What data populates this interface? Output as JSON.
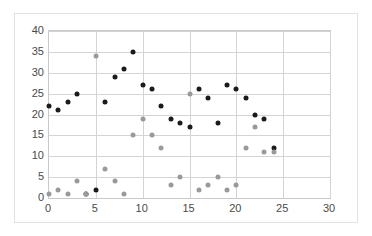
{
  "chart_data": {
    "type": "scatter",
    "title": "",
    "xlabel": "",
    "ylabel": "",
    "xlim": [
      0,
      30
    ],
    "ylim": [
      0,
      40
    ],
    "xticks": [
      0,
      5,
      10,
      15,
      20,
      25,
      30
    ],
    "yticks": [
      0,
      5,
      10,
      15,
      20,
      25,
      30,
      35,
      40
    ],
    "grid": true,
    "legend": "none",
    "series": [
      {
        "name": "dark-series",
        "color": "#1b1b1b",
        "x": [
          0,
          1,
          2,
          3,
          4,
          5,
          6,
          7,
          8,
          9,
          10,
          11,
          12,
          13,
          14,
          15,
          16,
          17,
          18,
          19,
          20,
          21,
          22,
          23,
          24
        ],
        "values": [
          22,
          21,
          23,
          25,
          1,
          2,
          23,
          29,
          31,
          35,
          27,
          26,
          22,
          19,
          18,
          17,
          26,
          24,
          18,
          27,
          26,
          24,
          20,
          19,
          12
        ]
      },
      {
        "name": "light-series",
        "color": "#9a9a9a",
        "x": [
          0,
          1,
          2,
          3,
          4,
          5,
          6,
          7,
          8,
          9,
          10,
          11,
          12,
          13,
          14,
          15,
          16,
          17,
          18,
          19,
          20,
          21,
          22,
          23,
          24
        ],
        "values": [
          1,
          2,
          1,
          4,
          1,
          34,
          7,
          4,
          1,
          15,
          19,
          15,
          12,
          3,
          5,
          25,
          2,
          3,
          5,
          2,
          3,
          12,
          17,
          11,
          11
        ]
      }
    ]
  }
}
